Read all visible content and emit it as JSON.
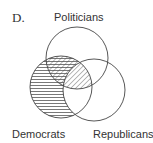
{
  "figure": {
    "option_label": "D.",
    "sets": [
      {
        "name": "Politicians",
        "cx": 77,
        "cy": 58,
        "r": 31
      },
      {
        "name": "Democrats",
        "cx": 61,
        "cy": 87,
        "r": 31
      },
      {
        "name": "Republicans",
        "cx": 94,
        "cy": 90,
        "r": 31
      }
    ],
    "shading": [
      {
        "region": "Democrats not Republicans",
        "pattern": "horizontal-lines"
      },
      {
        "region": "Democrats and Politicians",
        "pattern": "diagonal-lines"
      }
    ],
    "colors": {
      "stroke": "#444444",
      "hatch": "#555555",
      "background": "#ffffff"
    }
  }
}
